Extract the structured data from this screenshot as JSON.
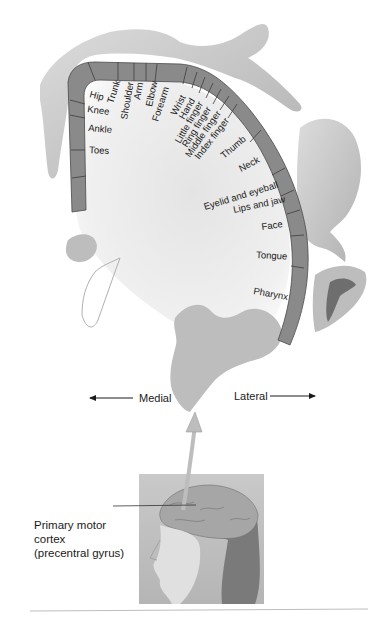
{
  "figure": {
    "body_part_labels": [
      {
        "id": "hip",
        "text": "Hip"
      },
      {
        "id": "trunk",
        "text": "Trunk"
      },
      {
        "id": "knee",
        "text": "Knee"
      },
      {
        "id": "shoulder",
        "text": "Shoulder"
      },
      {
        "id": "arm",
        "text": "Arm"
      },
      {
        "id": "elbow",
        "text": "Elbow"
      },
      {
        "id": "ankle",
        "text": "Ankle"
      },
      {
        "id": "forearm",
        "text": "Forearm"
      },
      {
        "id": "toes",
        "text": "Toes"
      },
      {
        "id": "wrist",
        "text": "Wrist"
      },
      {
        "id": "hand",
        "text": "Hand"
      },
      {
        "id": "little_finger",
        "text": "Little finger"
      },
      {
        "id": "ring_finger",
        "text": "Ring finger"
      },
      {
        "id": "middle_finger",
        "text": "Middle finger"
      },
      {
        "id": "index_finger",
        "text": "Index finger"
      },
      {
        "id": "thumb",
        "text": "Thumb"
      },
      {
        "id": "neck",
        "text": "Neck"
      },
      {
        "id": "eyelid_eyeball",
        "text": "Eyelid and eyeball"
      },
      {
        "id": "lips_jaw",
        "text": "Lips and jaw"
      },
      {
        "id": "face",
        "text": "Face"
      },
      {
        "id": "tongue",
        "text": "Tongue"
      },
      {
        "id": "pharynx",
        "text": "Pharynx"
      }
    ],
    "orientation": {
      "medial": "Medial",
      "lateral": "Lateral"
    },
    "callout": {
      "line1": "Primary motor",
      "line2": "cortex",
      "line3": "(precentral gyrus)"
    },
    "colors": {
      "cortex_band": "#8a8a8a",
      "gyrus_fill": "#bdbdbd",
      "body_shade": "#c8c8c8",
      "background": "#ffffff"
    }
  }
}
